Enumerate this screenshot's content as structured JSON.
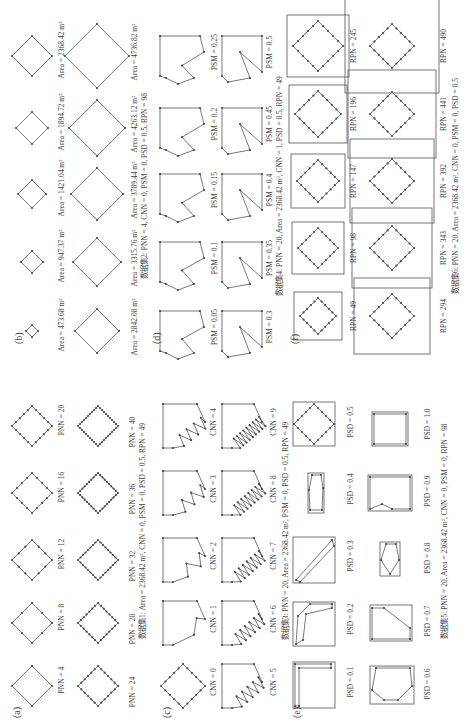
{
  "figure": {
    "orientation": "rotated-90-ccw",
    "panels": [
      {
        "id": "a",
        "label": "(a)",
        "items": [
          {
            "label": "PNN = 4",
            "pnn": 4
          },
          {
            "label": "PNN = 8",
            "pnn": 8
          },
          {
            "label": "PNN = 12",
            "pnn": 12
          },
          {
            "label": "PNN = 16",
            "pnn": 16
          },
          {
            "label": "PNN = 20",
            "pnn": 20
          },
          {
            "label": "PNN = 24",
            "pnn": 24
          },
          {
            "label": "PNN = 28",
            "pnn": 28
          },
          {
            "label": "PNN = 32",
            "pnn": 32
          },
          {
            "label": "PNN = 36",
            "pnn": 36
          },
          {
            "label": "PNN = 40",
            "pnn": 40
          }
        ],
        "caption": "数据集1:  Area = 2368.42 m², CNN = 0, PSM = 0, PSD = 0.5, RPN = 49"
      },
      {
        "id": "b",
        "label": "(b)",
        "items": [
          {
            "label": "Area = 473.68 m²",
            "area": 473.68
          },
          {
            "label": "Area = 947.37 m²",
            "area": 947.37
          },
          {
            "label": "Area = 1421.04 m²",
            "area": 1421.04
          },
          {
            "label": "Area = 1894.72 m²",
            "area": 1894.72
          },
          {
            "label": "Area = 2368.42 m²",
            "area": 2368.42
          },
          {
            "label": "Area = 2842.08 m²",
            "area": 2842.08
          },
          {
            "label": "Area = 3315.76 m²",
            "area": 3315.76
          },
          {
            "label": "Area = 3789.44 m²",
            "area": 3789.44
          },
          {
            "label": "Area = 4263.12 m²",
            "area": 4263.12
          },
          {
            "label": "Area = 4736.82 m²",
            "area": 4736.82
          }
        ],
        "caption": "数据集2:  PNN = 4, CNN = 0, PSM = 0, PSD = 0.5, RPN = 98"
      },
      {
        "id": "c",
        "label": "(c)",
        "items": [
          {
            "label": "CNN = 0",
            "cnn": 0
          },
          {
            "label": "CNN = 1",
            "cnn": 1
          },
          {
            "label": "CNN = 2",
            "cnn": 2
          },
          {
            "label": "CNN = 3",
            "cnn": 3
          },
          {
            "label": "CNN = 4",
            "cnn": 4
          },
          {
            "label": "CNN = 5",
            "cnn": 5
          },
          {
            "label": "CNN = 6",
            "cnn": 6
          },
          {
            "label": "CNN = 7",
            "cnn": 7
          },
          {
            "label": "CNN = 8",
            "cnn": 8
          },
          {
            "label": "CNN = 9",
            "cnn": 9
          }
        ],
        "caption": "数据集3:  PNN = 20, Area = 2368.42 m², PSM = 0, PSD = 0.5, RPN = 49"
      },
      {
        "id": "d",
        "label": "(d)",
        "items": [
          {
            "label": "PSM = 0.05",
            "psm": 0.05
          },
          {
            "label": "PSM = 0.1",
            "psm": 0.1
          },
          {
            "label": "PSM = 0.15",
            "psm": 0.15
          },
          {
            "label": "PSM = 0.2",
            "psm": 0.2
          },
          {
            "label": "PSM = 0.25",
            "psm": 0.25
          },
          {
            "label": "PSM = 0.3",
            "psm": 0.3
          },
          {
            "label": "PSM = 0.35",
            "psm": 0.35
          },
          {
            "label": "PSM = 0.4",
            "psm": 0.4
          },
          {
            "label": "PSM = 0.45",
            "psm": 0.45
          },
          {
            "label": "PSM = 0.5",
            "psm": 0.5
          }
        ],
        "caption": "数据集4:  PNN = 20, Area = 2368.42 m², CNN = 1, PSD = 0.5, RPN = 49"
      },
      {
        "id": "e",
        "label": "(e)",
        "items": [
          {
            "label": "PSD = 0.1",
            "psd": 0.1
          },
          {
            "label": "PSD = 0.2",
            "psd": 0.2
          },
          {
            "label": "PSD = 0.3",
            "psd": 0.3
          },
          {
            "label": "PSD = 0.4",
            "psd": 0.4
          },
          {
            "label": "PSD = 0.5",
            "psd": 0.5
          },
          {
            "label": "PSD = 0.6",
            "psd": 0.6
          },
          {
            "label": "PSD = 0.7",
            "psd": 0.7
          },
          {
            "label": "PSD = 0.8",
            "psd": 0.8
          },
          {
            "label": "PSD = 0.9",
            "psd": 0.9
          },
          {
            "label": "PSD = 1.0",
            "psd": 1.0
          }
        ],
        "caption": "数据集5:  PNN = 20, Area = 2368.42 m², CNN = 0, PSM = 0, RPN = 98"
      },
      {
        "id": "f",
        "label": "(f)",
        "items": [
          {
            "label": "RPN = 49",
            "rpn": 49
          },
          {
            "label": "RPN = 98",
            "rpn": 98
          },
          {
            "label": "RPN = 147",
            "rpn": 147
          },
          {
            "label": "RPN = 196",
            "rpn": 196
          },
          {
            "label": "RPN = 245",
            "rpn": 245
          },
          {
            "label": "RPN = 294",
            "rpn": 294
          },
          {
            "label": "RPN = 343",
            "rpn": 343
          },
          {
            "label": "RPN = 392",
            "rpn": 392
          },
          {
            "label": "RPN = 441",
            "rpn": 441
          },
          {
            "label": "RPN = 490",
            "rpn": 490
          }
        ],
        "caption": "数据集6:  PNN = 20, Area = 2368.42 m², CNN = 0, PSM = 0, PSD = 0.5"
      }
    ]
  },
  "colors": {
    "stroke": "#555555",
    "point": "#444444",
    "frame": "#666666",
    "text": "#444444",
    "background": "#ffffff"
  }
}
